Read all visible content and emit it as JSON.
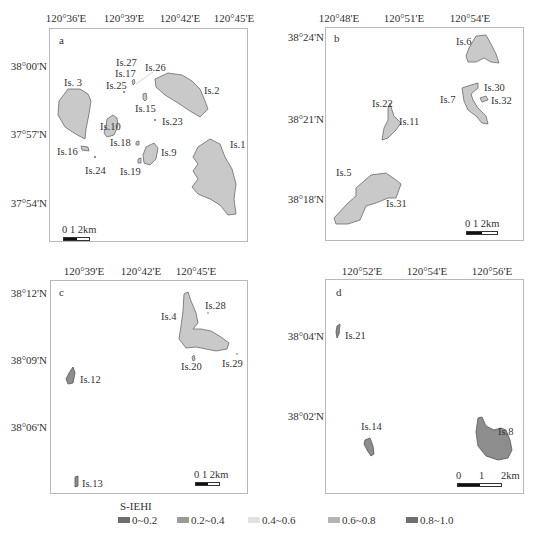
{
  "panels": {
    "a": {
      "letter": "a",
      "x_ticks": [
        "120°36'E",
        "120°39'E",
        "120°42'E",
        "120°45'E"
      ],
      "y_ticks": [
        "38°00'N",
        "37°57'N",
        "37°54'N"
      ],
      "islands": [
        "Is. 3",
        "Is.27",
        "Is.17",
        "Is.26",
        "Is.25",
        "Is.2",
        "Is.15",
        "Is.10",
        "Is.23",
        "Is.18",
        "Is.16",
        "Is.9",
        "Is.1",
        "Is.24",
        "Is.19"
      ],
      "scale": "0  1   2km"
    },
    "b": {
      "letter": "b",
      "x_ticks": [
        "120°48'E",
        "120°51'E",
        "120°54'E"
      ],
      "y_ticks": [
        "38°24'N",
        "38°21'N",
        "38°18'N"
      ],
      "islands": [
        "Is.6",
        "Is.30",
        "Is.7",
        "Is.32",
        "Is.22",
        "Is.11",
        "Is.5",
        "Is.31"
      ],
      "scale": "0  1   2km"
    },
    "c": {
      "letter": "c",
      "x_ticks": [
        "120°39'E",
        "120°42'E",
        "120°45'E"
      ],
      "y_ticks": [
        "38°12'N",
        "38°09'N",
        "38°06'N"
      ],
      "islands": [
        "Is.28",
        "Is.4",
        "Is.20",
        "Is.29",
        "Is.12",
        "Is.13"
      ],
      "scale": "0  1  2km"
    },
    "d": {
      "letter": "d",
      "x_ticks": [
        "120°52'E",
        "120°54'E",
        "120°56'E"
      ],
      "y_ticks": [
        "38°04'N",
        "38°02'N"
      ],
      "islands": [
        "Is.21",
        "Is.8",
        "Is.14"
      ],
      "scale_labels": [
        "0",
        "1",
        "2km"
      ]
    }
  },
  "legend": {
    "title": "S-IEHI",
    "items": [
      {
        "label": "0~0.2",
        "color": "#6e6e6e"
      },
      {
        "label": "0.2~0.4",
        "color": "#9a9a9a"
      },
      {
        "label": "0.4~0.6",
        "color": "#e2e2e2"
      },
      {
        "label": "0.6~0.8",
        "color": "#b4b4b4"
      },
      {
        "label": "0.8~1.0",
        "color": "#707070"
      }
    ]
  },
  "colors": {
    "island_fill": "#c9c9c9",
    "island_stroke": "#6a6a6a",
    "island_dark": "#8d8d8d",
    "frame": "#b8b8b8"
  }
}
